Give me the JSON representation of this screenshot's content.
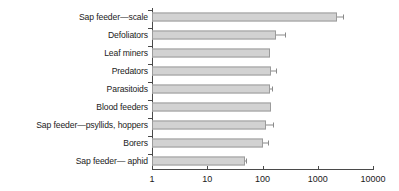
{
  "chart_data": {
    "type": "bar",
    "orientation": "horizontal",
    "title": "",
    "subtitle": "",
    "xlabel": "",
    "ylabel": "",
    "xscale": "log",
    "xlim": [
      1,
      10000
    ],
    "xticks": [
      "1",
      "10",
      "100",
      "1000",
      "10000"
    ],
    "xtick_values": [
      1,
      10,
      100,
      1000,
      10000
    ],
    "grid": false,
    "legend": null,
    "categories": [
      "Sap feeder—scale",
      "Defoliators",
      "Leaf miners",
      "Predators",
      "Parasitoids",
      "Blood feeders",
      "Sap feeder—psyllids, hoppers",
      "Borers",
      "Sap feeder— aphid"
    ],
    "values": [
      2200,
      172,
      138,
      142,
      137,
      140,
      118,
      101,
      48
    ],
    "error_high": [
      2850,
      255,
      138,
      172,
      148,
      140,
      152,
      125,
      51
    ],
    "series": [
      {
        "name": "Number of species",
        "values": [
          2200,
          172,
          138,
          142,
          137,
          140,
          118,
          101,
          48
        ]
      }
    ],
    "bar_fill_color": "#d2d2d2",
    "bar_edge_color": "#9b9b9b",
    "axis_color": "#4a4a4a",
    "error_bar_color": "#8a8a8a"
  }
}
